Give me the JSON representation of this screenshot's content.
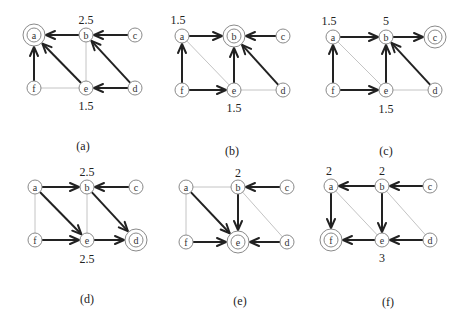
{
  "figure": {
    "width": 467,
    "height": 329,
    "colors": {
      "thin_edge": "#c4c4c4",
      "thick_edge": "#222222",
      "node_stroke": "#8a8a8a"
    },
    "panels": [
      {
        "id": "a",
        "caption": "(a)",
        "caption_pos": [
          83,
          146
        ],
        "nodes": {
          "a": [
            34,
            35
          ],
          "b": [
            86,
            35
          ],
          "c": [
            135,
            35
          ],
          "f": [
            34,
            88
          ],
          "e": [
            86,
            88
          ],
          "d": [
            135,
            88
          ]
        },
        "target": "a",
        "values": [
          {
            "node": "b",
            "text": "2.5",
            "pos": [
              86,
              20
            ]
          },
          {
            "node": "e",
            "text": "1.5",
            "pos": [
              86,
              106
            ]
          }
        ],
        "thin_edges": [
          [
            "b",
            "e"
          ],
          [
            "f",
            "e"
          ]
        ],
        "arrows": [
          [
            "b",
            "a"
          ],
          [
            "c",
            "b"
          ],
          [
            "f",
            "a"
          ],
          [
            "e",
            "a"
          ],
          [
            "d",
            "b"
          ],
          [
            "d",
            "e"
          ]
        ]
      },
      {
        "id": "b",
        "caption": "(b)",
        "caption_pos": [
          232,
          151
        ],
        "nodes": {
          "a": [
            182,
            36
          ],
          "b": [
            234,
            36
          ],
          "c": [
            283,
            36
          ],
          "f": [
            182,
            90
          ],
          "e": [
            234,
            90
          ],
          "d": [
            283,
            90
          ]
        },
        "target": "b",
        "values": [
          {
            "node": "a",
            "text": "1.5",
            "pos": [
              178,
              20
            ]
          },
          {
            "node": "e",
            "text": "1.5",
            "pos": [
              234,
              108
            ]
          }
        ],
        "thin_edges": [
          [
            "a",
            "e"
          ],
          [
            "e",
            "d"
          ]
        ],
        "arrows": [
          [
            "a",
            "b"
          ],
          [
            "c",
            "b"
          ],
          [
            "f",
            "a"
          ],
          [
            "f",
            "e"
          ],
          [
            "e",
            "b"
          ],
          [
            "d",
            "b"
          ]
        ]
      },
      {
        "id": "c",
        "caption": "(c)",
        "caption_pos": [
          386,
          151
        ],
        "nodes": {
          "a": [
            333,
            37
          ],
          "b": [
            386,
            37
          ],
          "c": [
            435,
            37
          ],
          "f": [
            333,
            90
          ],
          "e": [
            386,
            90
          ],
          "d": [
            435,
            90
          ]
        },
        "target": "c",
        "values": [
          {
            "node": "a",
            "text": "1.5",
            "pos": [
              329,
              21
            ]
          },
          {
            "node": "b",
            "text": "5",
            "pos": [
              386,
              21
            ]
          },
          {
            "node": "e",
            "text": "1.5",
            "pos": [
              386,
              109
            ]
          }
        ],
        "thin_edges": [
          [
            "a",
            "e"
          ],
          [
            "e",
            "d"
          ]
        ],
        "arrows": [
          [
            "a",
            "b"
          ],
          [
            "b",
            "c"
          ],
          [
            "f",
            "a"
          ],
          [
            "f",
            "e"
          ],
          [
            "e",
            "b"
          ],
          [
            "d",
            "b"
          ]
        ]
      },
      {
        "id": "d",
        "caption": "(d)",
        "caption_pos": [
          87,
          299
        ],
        "nodes": {
          "a": [
            35,
            187
          ],
          "b": [
            87,
            187
          ],
          "c": [
            136,
            187
          ],
          "f": [
            35,
            240
          ],
          "e": [
            87,
            240
          ],
          "d": [
            136,
            240
          ]
        },
        "target": "d",
        "values": [
          {
            "node": "b",
            "text": "2.5",
            "pos": [
              87,
              172
            ]
          },
          {
            "node": "e",
            "text": "2.5",
            "pos": [
              87,
              259
            ]
          }
        ],
        "thin_edges": [
          [
            "a",
            "f"
          ],
          [
            "b",
            "e"
          ]
        ],
        "arrows": [
          [
            "a",
            "b"
          ],
          [
            "c",
            "b"
          ],
          [
            "a",
            "e"
          ],
          [
            "b",
            "d"
          ],
          [
            "f",
            "e"
          ],
          [
            "e",
            "d"
          ]
        ]
      },
      {
        "id": "e",
        "caption": "(e)",
        "caption_pos": [
          240,
          301
        ],
        "nodes": {
          "a": [
            186,
            187
          ],
          "b": [
            238,
            187
          ],
          "c": [
            287,
            187
          ],
          "f": [
            186,
            242
          ],
          "e": [
            238,
            242
          ],
          "d": [
            287,
            242
          ]
        },
        "target": "e",
        "values": [
          {
            "node": "b",
            "text": "2",
            "pos": [
              238,
              173
            ]
          }
        ],
        "thin_edges": [
          [
            "a",
            "b"
          ],
          [
            "a",
            "f"
          ],
          [
            "b",
            "d"
          ]
        ],
        "arrows": [
          [
            "c",
            "b"
          ],
          [
            "a",
            "e"
          ],
          [
            "b",
            "e"
          ],
          [
            "f",
            "e"
          ],
          [
            "d",
            "e"
          ]
        ]
      },
      {
        "id": "f",
        "caption": "(f)",
        "caption_pos": [
          388,
          302
        ],
        "nodes": {
          "a": [
            331,
            186
          ],
          "b": [
            382,
            186
          ],
          "c": [
            430,
            186
          ],
          "f": [
            331,
            240
          ],
          "e": [
            382,
            240
          ],
          "d": [
            430,
            240
          ]
        },
        "target": "f",
        "values": [
          {
            "node": "a",
            "text": "2",
            "pos": [
              329,
              171
            ]
          },
          {
            "node": "b",
            "text": "2",
            "pos": [
              382,
              171
            ]
          },
          {
            "node": "e",
            "text": "3",
            "pos": [
              382,
              258
            ]
          }
        ],
        "thin_edges": [
          [
            "a",
            "e"
          ],
          [
            "b",
            "d"
          ]
        ],
        "arrows": [
          [
            "b",
            "a"
          ],
          [
            "c",
            "b"
          ],
          [
            "a",
            "f"
          ],
          [
            "b",
            "e"
          ],
          [
            "e",
            "f"
          ],
          [
            "d",
            "e"
          ]
        ]
      }
    ]
  }
}
